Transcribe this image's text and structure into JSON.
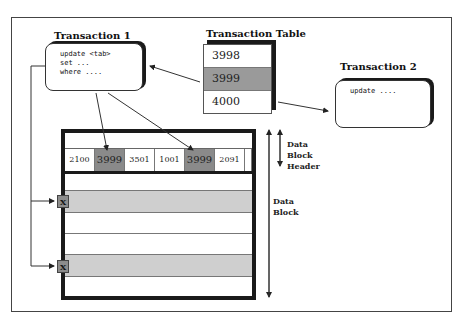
{
  "transaction1": {
    "title": "Transaction 1",
    "code": [
      "update <tab>",
      "set ...",
      "where ...."
    ]
  },
  "transaction_table": {
    "title": "Transaction Table",
    "rows": [
      {
        "value": "3998",
        "highlighted": false
      },
      {
        "value": "3999",
        "highlighted": true
      },
      {
        "value": "4000",
        "highlighted": false
      }
    ]
  },
  "transaction2": {
    "title": "Transaction 2",
    "code": [
      "update ...."
    ]
  },
  "data_block": {
    "header_cells": [
      {
        "value": "2100",
        "highlighted": false
      },
      {
        "value": "3999",
        "highlighted": true
      },
      {
        "value": "3501",
        "highlighted": false
      },
      {
        "value": "1001",
        "highlighted": false
      },
      {
        "value": "3999",
        "highlighted": true
      },
      {
        "value": "2091",
        "highlighted": false
      }
    ],
    "locked_rows": [
      {
        "marker": "X"
      },
      {
        "marker": "X"
      }
    ]
  },
  "labels": {
    "header_label": [
      "Data",
      "Block",
      "Header"
    ],
    "block_label": [
      "Data",
      "Block"
    ]
  },
  "colors": {
    "highlight_dark": "#8a8a8a",
    "highlight_light": "#cfcfcf",
    "border": "#1a1a1a"
  }
}
